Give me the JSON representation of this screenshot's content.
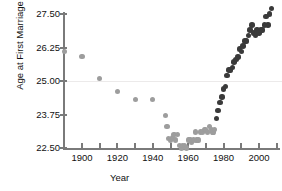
{
  "chart_data": {
    "type": "scatter",
    "title": "",
    "xlabel": "Year",
    "ylabel": "Age at First Marriage",
    "xlim": [
      1885,
      2010
    ],
    "ylim": [
      22.2,
      27.8
    ],
    "yticks": [
      22.5,
      23.75,
      25.0,
      26.25,
      27.5
    ],
    "ytick_labels": [
      "22.50",
      "23.75",
      "25.00",
      "26.25",
      "27.50"
    ],
    "xticks": [
      1900,
      1920,
      1940,
      1960,
      1980,
      2000
    ],
    "xtick_labels": [
      "1900",
      "1920",
      "1940",
      "1960",
      "1980",
      "2000"
    ],
    "xminor_ticks": [
      1890,
      1910,
      1930,
      1950,
      1970,
      1990,
      2010
    ],
    "grid": false,
    "reference_line_y": 24.6,
    "colors": {
      "light_series": "#9d9d9d",
      "dark_series": "#3a3a3a",
      "axis": "#7a7a7a",
      "text": "#111111"
    },
    "series": [
      {
        "name": "Early / decennial estimates",
        "color": "#9d9d9d",
        "points": [
          [
            1890,
            26.1
          ],
          [
            1900,
            25.9
          ],
          [
            1910,
            25.1
          ],
          [
            1920,
            24.6
          ],
          [
            1930,
            24.3
          ],
          [
            1940,
            24.3
          ],
          [
            1947,
            23.7
          ],
          [
            1948,
            23.3
          ],
          [
            1949,
            22.85
          ],
          [
            1950,
            22.8
          ],
          [
            1951,
            22.9
          ],
          [
            1952,
            23.0
          ],
          [
            1953,
            22.8
          ],
          [
            1954,
            23.0
          ],
          [
            1955,
            22.6
          ],
          [
            1956,
            22.5
          ],
          [
            1957,
            22.6
          ],
          [
            1958,
            22.6
          ],
          [
            1959,
            22.5
          ],
          [
            1960,
            22.8
          ],
          [
            1961,
            22.8
          ],
          [
            1962,
            22.7
          ],
          [
            1963,
            22.8
          ],
          [
            1964,
            23.1
          ],
          [
            1965,
            22.8
          ],
          [
            1966,
            22.8
          ],
          [
            1967,
            23.1
          ],
          [
            1968,
            23.1
          ],
          [
            1969,
            23.2
          ],
          [
            1970,
            23.2
          ],
          [
            1971,
            23.1
          ],
          [
            1972,
            23.3
          ],
          [
            1973,
            23.2
          ],
          [
            1974,
            23.1
          ],
          [
            1975,
            23.2
          ]
        ]
      },
      {
        "name": "Recent survey estimates",
        "color": "#3a3a3a",
        "points": [
          [
            1976,
            23.6
          ],
          [
            1977,
            23.9
          ],
          [
            1978,
            24.2
          ],
          [
            1979,
            24.4
          ],
          [
            1980,
            24.7
          ],
          [
            1981,
            24.8
          ],
          [
            1982,
            25.2
          ],
          [
            1983,
            25.4
          ],
          [
            1984,
            25.4
          ],
          [
            1985,
            25.5
          ],
          [
            1986,
            25.7
          ],
          [
            1987,
            25.8
          ],
          [
            1988,
            25.9
          ],
          [
            1989,
            26.2
          ],
          [
            1990,
            26.1
          ],
          [
            1991,
            26.3
          ],
          [
            1992,
            26.5
          ],
          [
            1993,
            26.5
          ],
          [
            1994,
            26.7
          ],
          [
            1995,
            26.9
          ],
          [
            1996,
            27.1
          ],
          [
            1997,
            26.8
          ],
          [
            1998,
            26.7
          ],
          [
            1999,
            26.9
          ],
          [
            2000,
            26.8
          ],
          [
            2001,
            26.9
          ],
          [
            2002,
            26.9
          ],
          [
            2003,
            27.1
          ],
          [
            2004,
            27.4
          ],
          [
            2005,
            27.1
          ],
          [
            2006,
            27.5
          ],
          [
            2007,
            27.7
          ]
        ]
      }
    ]
  }
}
